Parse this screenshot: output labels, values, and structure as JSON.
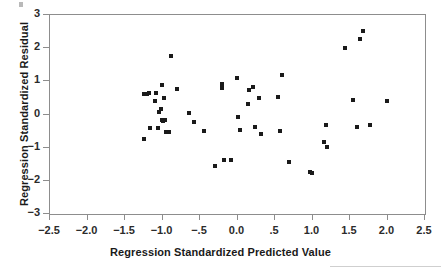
{
  "chart_data": {
    "type": "scatter",
    "title": "",
    "xlabel": "Regression Standardized Predicted Value",
    "ylabel": "Regression Standardized Residual",
    "xlim": [
      -2.5,
      2.5
    ],
    "ylim": [
      -3,
      3
    ],
    "grid": false,
    "legend": "none",
    "marker": "filled-square",
    "marker_color": "#1a1a1a",
    "xticks": [
      -2.5,
      -2.0,
      -1.5,
      -1.0,
      -0.5,
      0.0,
      0.5,
      1.0,
      1.5,
      2.0,
      2.5
    ],
    "xtick_labels": [
      "−2.5",
      "−2.0",
      "−1.5",
      "−1.0",
      "−.5",
      "0.0",
      ".5",
      "1.0",
      "1.5",
      "2.0",
      "2.5"
    ],
    "yticks": [
      3,
      2,
      1,
      0,
      -1,
      -2,
      -3
    ],
    "ytick_labels": [
      "3",
      "2",
      "1",
      "0",
      "−1",
      "−2",
      "−3"
    ],
    "n_points": 52,
    "points": [
      {
        "x": -1.23,
        "y": -0.76
      },
      {
        "x": -1.23,
        "y": 0.6
      },
      {
        "x": -1.2,
        "y": 0.6
      },
      {
        "x": -1.17,
        "y": 0.62
      },
      {
        "x": -1.15,
        "y": -0.45
      },
      {
        "x": -1.09,
        "y": 0.38
      },
      {
        "x": -1.07,
        "y": 0.63
      },
      {
        "x": -1.05,
        "y": -0.44
      },
      {
        "x": -1.03,
        "y": 0.05
      },
      {
        "x": -1.01,
        "y": 0.14
      },
      {
        "x": -1.0,
        "y": -0.2
      },
      {
        "x": -0.99,
        "y": 0.86
      },
      {
        "x": -0.98,
        "y": -0.22
      },
      {
        "x": -0.97,
        "y": 0.48
      },
      {
        "x": -0.95,
        "y": -0.2
      },
      {
        "x": -0.94,
        "y": -0.56
      },
      {
        "x": -0.9,
        "y": -0.56
      },
      {
        "x": -0.88,
        "y": 1.72
      },
      {
        "x": -0.8,
        "y": 0.73
      },
      {
        "x": -0.63,
        "y": 0.03
      },
      {
        "x": -0.57,
        "y": -0.25
      },
      {
        "x": -0.43,
        "y": -0.53
      },
      {
        "x": -0.29,
        "y": -1.58
      },
      {
        "x": -0.2,
        "y": 0.9
      },
      {
        "x": -0.19,
        "y": 0.76
      },
      {
        "x": -0.17,
        "y": -1.4
      },
      {
        "x": -0.08,
        "y": -1.4
      },
      {
        "x": 0.01,
        "y": 1.07
      },
      {
        "x": 0.02,
        "y": -0.11
      },
      {
        "x": 0.04,
        "y": -0.49
      },
      {
        "x": 0.15,
        "y": 0.3
      },
      {
        "x": 0.17,
        "y": 0.7
      },
      {
        "x": 0.22,
        "y": 0.79
      },
      {
        "x": 0.25,
        "y": -0.4
      },
      {
        "x": 0.3,
        "y": 0.46
      },
      {
        "x": 0.33,
        "y": -0.62
      },
      {
        "x": 0.55,
        "y": 0.5
      },
      {
        "x": 0.58,
        "y": -0.52
      },
      {
        "x": 0.6,
        "y": 1.16
      },
      {
        "x": 0.7,
        "y": -1.47
      },
      {
        "x": 0.98,
        "y": -1.76
      },
      {
        "x": 1.01,
        "y": -1.79
      },
      {
        "x": 1.17,
        "y": -0.85
      },
      {
        "x": 1.19,
        "y": -0.35
      },
      {
        "x": 1.21,
        "y": -1.02
      },
      {
        "x": 1.45,
        "y": 1.96
      },
      {
        "x": 1.55,
        "y": 0.42
      },
      {
        "x": 1.6,
        "y": -0.41
      },
      {
        "x": 1.65,
        "y": 2.26
      },
      {
        "x": 1.69,
        "y": 2.48
      },
      {
        "x": 1.78,
        "y": -0.34
      },
      {
        "x": 2.01,
        "y": 0.37
      }
    ]
  }
}
